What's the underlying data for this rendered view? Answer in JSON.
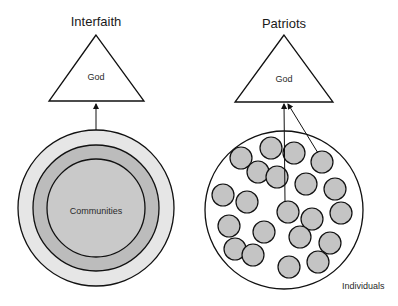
{
  "diagram": {
    "left": {
      "title": "Interfaith",
      "top_label": "God",
      "center_label": "Communities",
      "rings": [
        {
          "r": 78,
          "fill": "#e6e6e6"
        },
        {
          "r": 63,
          "fill": "#bcbcbc"
        },
        {
          "r": 49,
          "fill": "#c9c9c9"
        }
      ]
    },
    "right": {
      "title": "Patriots",
      "top_label": "God",
      "corner_label": "Individuals",
      "individual_fill": "#c4c4c4",
      "individuals": [
        [
          271,
          148
        ],
        [
          241,
          158
        ],
        [
          294,
          153
        ],
        [
          322,
          162
        ],
        [
          258,
          172
        ],
        [
          277,
          177
        ],
        [
          306,
          184
        ],
        [
          335,
          189
        ],
        [
          223,
          195
        ],
        [
          247,
          202
        ],
        [
          288,
          212
        ],
        [
          312,
          219
        ],
        [
          341,
          213
        ],
        [
          229,
          226
        ],
        [
          264,
          232
        ],
        [
          300,
          237
        ],
        [
          330,
          243
        ],
        [
          235,
          249
        ],
        [
          253,
          255
        ],
        [
          318,
          262
        ],
        [
          289,
          267
        ]
      ]
    }
  }
}
